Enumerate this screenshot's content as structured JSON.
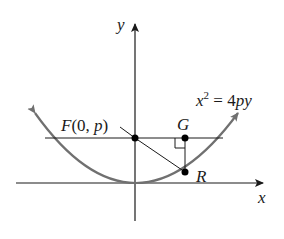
{
  "diagram": {
    "type": "parabola-focus-reflection",
    "labels": {
      "y_axis": "y",
      "x_axis": "x",
      "focus": "F(0, p)",
      "focus_F": "F",
      "focus_open": "(0, ",
      "focus_p": "p",
      "focus_close": ")",
      "point_G": "G",
      "point_R": "R",
      "equation_x": "x",
      "equation_exp": "2",
      "equation_eq": " = 4",
      "equation_py": "py"
    },
    "points": {
      "F": {
        "x": 135,
        "y": 138
      },
      "G": {
        "x": 185,
        "y": 138
      },
      "R": {
        "x": 185,
        "y": 172
      }
    },
    "colors": {
      "axis": "#1a1a1a",
      "curve": "#707070",
      "line": "#1a1a1a",
      "point": "#000000"
    }
  }
}
